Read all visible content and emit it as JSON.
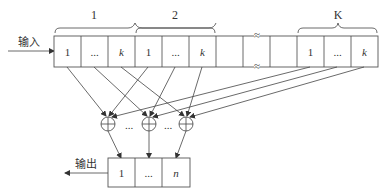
{
  "diagram": {
    "type": "block-diagram",
    "input_label": "输入",
    "output_label": "输出",
    "groups": [
      {
        "label": "1",
        "cells": [
          "1",
          "...",
          "k"
        ]
      },
      {
        "label": "2",
        "cells": [
          "1",
          "...",
          "k"
        ]
      },
      {
        "label": "K",
        "cells": [
          "1",
          "...",
          "k"
        ]
      }
    ],
    "middle_cells": [
      "",
      "",
      ""
    ],
    "break_mark": "≈",
    "adders": [
      {
        "symbol": "⊕"
      },
      {
        "symbol": "⊕"
      },
      {
        "symbol": "⊕"
      }
    ],
    "adder_separators": [
      "...",
      "..."
    ],
    "output_cells": [
      "1",
      "...",
      "n"
    ],
    "connections": [
      {
        "from": "group1.cell1",
        "to": "adder1"
      },
      {
        "from": "group1.cell2",
        "to": "adder2"
      },
      {
        "from": "group1.cell3",
        "to": "adder3"
      },
      {
        "from": "group2.cell1",
        "to": "adder1"
      },
      {
        "from": "group2.cell2",
        "to": "adder2"
      },
      {
        "from": "group2.cell3",
        "to": "adder3"
      },
      {
        "from": "groupK.cell1",
        "to": "adder1"
      },
      {
        "from": "groupK.cell2",
        "to": "adder2"
      },
      {
        "from": "groupK.cell3",
        "to": "adder3"
      },
      {
        "from": "adder1",
        "to": "output.cell1"
      },
      {
        "from": "adder2",
        "to": "output.cell2"
      },
      {
        "from": "adder3",
        "to": "output.cell3"
      }
    ]
  }
}
